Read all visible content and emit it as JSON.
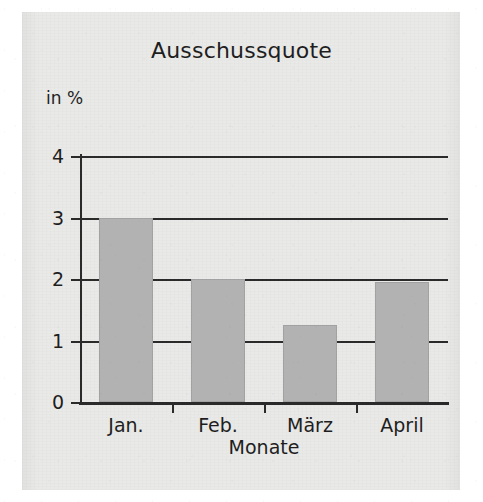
{
  "chart_data": {
    "type": "bar",
    "title": "Ausschussquote",
    "xlabel": "Monate",
    "ylabel": "in %",
    "categories": [
      "Jan.",
      "Feb.",
      "März",
      "April"
    ],
    "values": [
      3.0,
      2.0,
      1.25,
      1.95
    ],
    "series": [
      {
        "name": "Ausschussquote",
        "values": [
          3.0,
          2.0,
          1.25,
          1.95
        ]
      }
    ],
    "ylim": [
      0,
      4
    ],
    "yticks": [
      "0",
      "1",
      "2",
      "3",
      "4"
    ],
    "ytick_values": [
      0,
      1,
      2,
      3,
      4
    ],
    "grid": "horizontal",
    "legend": "none",
    "bar_color": "#b2b2b2",
    "axis_color": "#2a2a2a",
    "background_color": "#e9e9e8"
  },
  "figure": {
    "title": "Ausschussquote",
    "y_unit_label": "in %",
    "x_axis_title": "Monate"
  }
}
